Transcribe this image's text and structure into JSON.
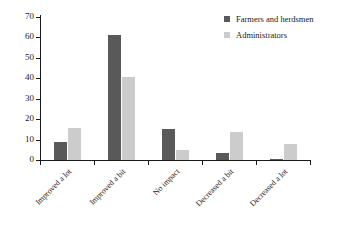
{
  "chart_data": {
    "type": "bar",
    "title": "",
    "xlabel": "",
    "ylabel": "Percentage/%",
    "ylim": [
      0,
      70
    ],
    "yticks": [
      0,
      10,
      20,
      30,
      40,
      50,
      60,
      70
    ],
    "grid": false,
    "legend_position": "top-right",
    "categories": [
      "Improved a lot",
      "Improved a bit",
      "No impact",
      "Decreased a bit",
      "Decreased a lot"
    ],
    "series": [
      {
        "name": "Farmers and herdsmen",
        "color": "#595959",
        "values": [
          9,
          61,
          15,
          3.5,
          0.7
        ]
      },
      {
        "name": "Administrators",
        "color": "#cccccc",
        "values": [
          15.5,
          40.5,
          5,
          13.5,
          8
        ]
      }
    ]
  },
  "axis": {
    "y_title": "Percentage/%"
  },
  "legend": {
    "items": [
      {
        "label": "Farmers and herdsmen",
        "swatch": "dark"
      },
      {
        "label": "Administrators",
        "swatch": "light"
      }
    ]
  }
}
